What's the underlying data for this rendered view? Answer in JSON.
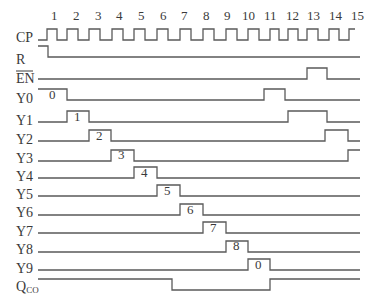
{
  "figure": {
    "type": "timing-diagram",
    "clock_label": "CP",
    "clock_pulse_numbers": [
      "1",
      "2",
      "3",
      "4",
      "5",
      "6",
      "7",
      "8",
      "9",
      "10",
      "11",
      "12",
      "13",
      "14",
      "15"
    ],
    "signals": [
      {
        "label": "CP",
        "kind": "clock"
      },
      {
        "label": "R",
        "kind": "reset"
      },
      {
        "label": "EN",
        "kind": "enable",
        "overbar": true
      },
      {
        "label": "Y0",
        "pulse_label": "0"
      },
      {
        "label": "Y1",
        "pulse_label": "1"
      },
      {
        "label": "Y2",
        "pulse_label": "2"
      },
      {
        "label": "Y3",
        "pulse_label": "3"
      },
      {
        "label": "Y4",
        "pulse_label": "4"
      },
      {
        "label": "Y5",
        "pulse_label": "5"
      },
      {
        "label": "Y6",
        "pulse_label": "6"
      },
      {
        "label": "Y7",
        "pulse_label": "7"
      },
      {
        "label": "Y8",
        "pulse_label": "8"
      },
      {
        "label": "Y9",
        "pulse_label": "0"
      },
      {
        "label": "Q",
        "subscript": "CO"
      }
    ],
    "colors": {
      "line": "#5a5a5a",
      "text": "#3a3a3a",
      "background": "#ffffff"
    }
  }
}
